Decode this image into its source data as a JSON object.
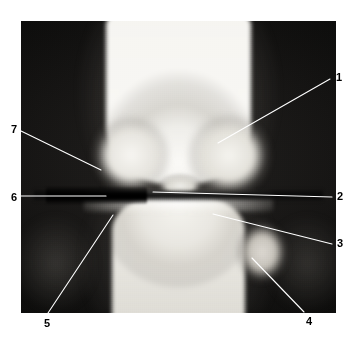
{
  "figure": {
    "kind": "radiograph",
    "view": "anteroposterior-knee-xray",
    "background_color": "#ffffff",
    "plate_color": "#0a0a0a",
    "leader_line_color": "#ffffff",
    "label_color": "#000000",
    "plate": {
      "x": 21,
      "y": 21,
      "width": 315,
      "height": 292
    }
  },
  "annotations": [
    {
      "id": "1",
      "label": "1",
      "label_x": 336,
      "label_y": 72,
      "line": {
        "x1": 330,
        "y1": 79,
        "x2": 218,
        "y2": 143
      }
    },
    {
      "id": "2",
      "label": "2",
      "label_x": 337,
      "label_y": 191,
      "line": {
        "x1": 332,
        "y1": 197,
        "x2": 153,
        "y2": 192
      }
    },
    {
      "id": "3",
      "label": "3",
      "label_x": 337,
      "label_y": 238,
      "line": {
        "x1": 332,
        "y1": 244,
        "x2": 213,
        "y2": 214
      }
    },
    {
      "id": "4",
      "label": "4",
      "label_x": 306,
      "label_y": 316,
      "line": {
        "x1": 304,
        "y1": 312,
        "x2": 252,
        "y2": 258
      }
    },
    {
      "id": "5",
      "label": "5",
      "label_x": 44,
      "label_y": 318,
      "line": {
        "x1": 48,
        "y1": 313,
        "x2": 113,
        "y2": 215
      }
    },
    {
      "id": "6",
      "label": "6",
      "label_x": 11,
      "label_y": 192,
      "line": {
        "x1": 21,
        "y1": 196,
        "x2": 106,
        "y2": 196
      }
    },
    {
      "id": "7",
      "label": "7",
      "label_x": 11,
      "label_y": 124,
      "line": {
        "x1": 21,
        "y1": 131,
        "x2": 101,
        "y2": 170
      }
    }
  ]
}
